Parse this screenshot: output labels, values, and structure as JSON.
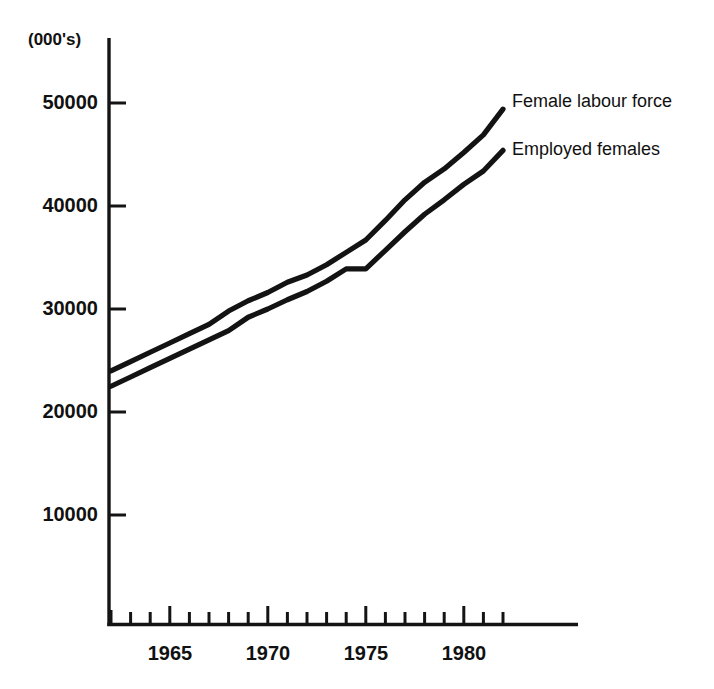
{
  "chart_data": {
    "type": "line",
    "title": "",
    "subtitle": "",
    "xlabel": "",
    "ylabel": "(000's)",
    "unit_note": "(000's)",
    "xlim": [
      1962,
      1982
    ],
    "ylim": [
      0,
      55000
    ],
    "grid": false,
    "legend_position": "right-inline",
    "y_ticks": [
      10000,
      20000,
      30000,
      40000,
      50000
    ],
    "y_tick_labels": [
      "10000",
      "20000",
      "30000",
      "40000",
      "50000"
    ],
    "x_ticks": [
      1962,
      1963,
      1964,
      1965,
      1966,
      1967,
      1968,
      1969,
      1970,
      1971,
      1972,
      1973,
      1974,
      1975,
      1976,
      1977,
      1978,
      1979,
      1980,
      1981,
      1982
    ],
    "x_tick_labels": [
      "",
      "",
      "",
      "1965",
      "",
      "",
      "",
      "",
      "1970",
      "",
      "",
      "",
      "",
      "1975",
      "",
      "",
      "",
      "",
      "1980",
      "",
      ""
    ],
    "x_labeled_ticks": [
      {
        "year": 1965,
        "label": "1965"
      },
      {
        "year": 1970,
        "label": "1970"
      },
      {
        "year": 1975,
        "label": "1975"
      },
      {
        "year": 1980,
        "label": "1980"
      }
    ],
    "x": [
      1962,
      1963,
      1964,
      1965,
      1966,
      1967,
      1968,
      1969,
      1970,
      1971,
      1972,
      1973,
      1974,
      1975,
      1976,
      1977,
      1978,
      1979,
      1980,
      1981,
      1982
    ],
    "series": [
      {
        "name": "Female labour force",
        "label": "Female labour force",
        "color": "#131313",
        "values": [
          24000,
          24900,
          25800,
          26700,
          27600,
          28500,
          29800,
          30800,
          31600,
          32600,
          33300,
          34300,
          35500,
          36700,
          38600,
          40600,
          42300,
          43600,
          45200,
          46900,
          49400
        ]
      },
      {
        "name": "Employed females",
        "label": "Employed females",
        "color": "#131313",
        "values": [
          22500,
          23400,
          24300,
          25200,
          26100,
          27000,
          27900,
          29200,
          30000,
          30900,
          31700,
          32700,
          33900,
          33900,
          35700,
          37500,
          39200,
          40600,
          42100,
          43400,
          45400
        ]
      }
    ],
    "annotations": []
  },
  "legend": {
    "items": [
      {
        "label": "Female labour force"
      },
      {
        "label": "Employed females"
      }
    ]
  }
}
